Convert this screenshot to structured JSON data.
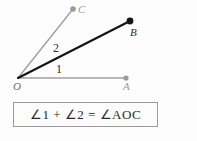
{
  "figure": {
    "background_color": "#fdfdfd",
    "title": "",
    "points": [
      {
        "id": "O",
        "label": "O",
        "x": 18,
        "y": 78,
        "label_x": 13,
        "label_y": 81,
        "dot": false,
        "color": "#8c8c8c"
      },
      {
        "id": "A",
        "label": "A",
        "x": 126,
        "y": 78,
        "label_x": 123,
        "label_y": 81,
        "dot": true,
        "color": "#9a9a9a"
      },
      {
        "id": "B",
        "label": "B",
        "x": 130,
        "y": 21,
        "label_x": 130,
        "label_y": 27,
        "dot": true,
        "color": "#111111"
      },
      {
        "id": "C",
        "label": "C",
        "x": 73,
        "y": 9,
        "label_x": 78,
        "label_y": 4,
        "dot": true,
        "color": "#9a9a9a"
      }
    ],
    "rays": [
      {
        "id": "ray-OA",
        "from": "O",
        "to": "A",
        "color": "#a0a0a0",
        "width": 1.4
      },
      {
        "id": "ray-OB",
        "from": "O",
        "to": "B",
        "color": "#141414",
        "width": 2.1
      },
      {
        "id": "ray-OC",
        "from": "O",
        "to": "C",
        "color": "#a0a0a0",
        "width": 1.4
      }
    ],
    "angle_labels": [
      {
        "id": "angle-1",
        "text": "1",
        "x": 56,
        "y": 63
      },
      {
        "id": "angle-2",
        "text": "2",
        "x": 53,
        "y": 42
      }
    ],
    "equation": {
      "text": "∠1 + ∠2 = ∠AOC",
      "border_color": "#9a9a9a",
      "background_color": "#fcfcfc"
    }
  }
}
